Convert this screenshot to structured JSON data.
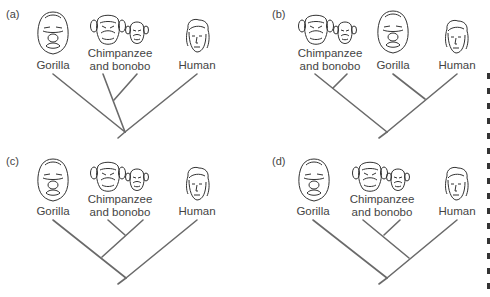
{
  "figure": {
    "panels": [
      {
        "id": "a",
        "label": "(a)",
        "taxa": {
          "gorilla": "Gorilla",
          "chimp_line1": "Chimpanzee",
          "chimp_line2": "and bonobo",
          "human": "Human"
        },
        "topology": "((Chimpanzee, Bonobo), Gorilla, Human) — trichotomy at root with chimp+bonobo clade"
      },
      {
        "id": "b",
        "label": "(b)",
        "taxa": {
          "chimp_line1": "Chimpanzee",
          "chimp_line2": "and bonobo",
          "gorilla": "Gorilla",
          "human": "Human"
        },
        "topology": "((Chimpanzee, Bonobo), (Gorilla, Human))"
      },
      {
        "id": "c",
        "label": "(c)",
        "taxa": {
          "gorilla": "Gorilla",
          "chimp_line1": "Chimpanzee",
          "chimp_line2": "and bonobo",
          "human": "Human"
        },
        "topology": "(((Chimpanzee, Bonobo), Gorilla), Human)"
      },
      {
        "id": "d",
        "label": "(d)",
        "taxa": {
          "gorilla": "Gorilla",
          "chimp_line1": "Chimpanzee",
          "chimp_line2": "and bonobo",
          "human": "Human"
        },
        "topology": "(Gorilla, ((Chimpanzee, Bonobo), Human))"
      }
    ],
    "colors": {
      "branch": "#6a6a6a",
      "text": "#444444",
      "background": "#ffffff"
    }
  }
}
